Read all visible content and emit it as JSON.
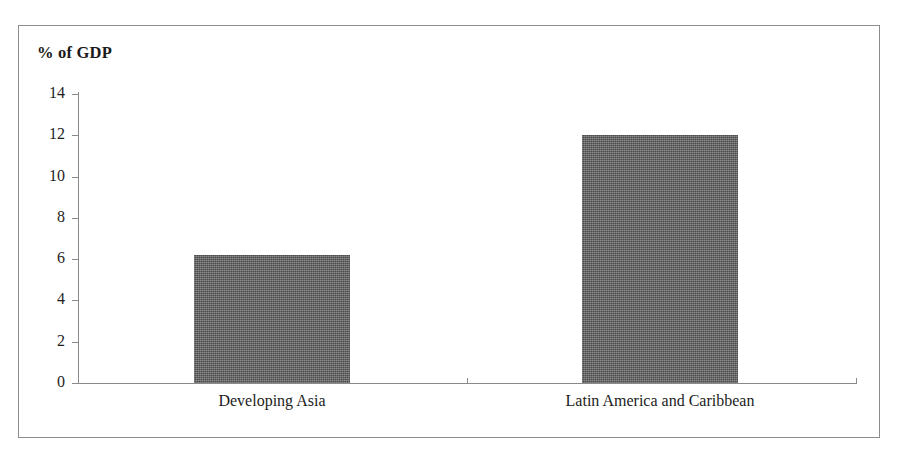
{
  "chart_data": {
    "type": "bar",
    "title": "% of GDP",
    "xlabel": "",
    "ylabel": "% of GDP",
    "categories": [
      "Developing Asia",
      "Latin America and Caribbean"
    ],
    "values": [
      6.2,
      12.0
    ],
    "ylim": [
      0,
      14
    ],
    "ytick_labels": [
      "0",
      "2",
      "4",
      "6",
      "8",
      "10",
      "12",
      "14"
    ],
    "ytick_values": [
      0,
      2,
      4,
      6,
      8,
      10,
      12,
      14
    ],
    "grid": false,
    "legend": null,
    "legend_position": "none",
    "series": [
      {
        "name": "% of GDP",
        "values": [
          6.2,
          12.0
        ],
        "color": "#5d5d5d"
      }
    ],
    "annotations": []
  },
  "figure": {
    "border_color": "#8d8d8d",
    "axis_color": "#8a8a8a",
    "background": "#ffffff",
    "bar_color": "#5d5d5d",
    "text_color": "#1a1a1a"
  }
}
